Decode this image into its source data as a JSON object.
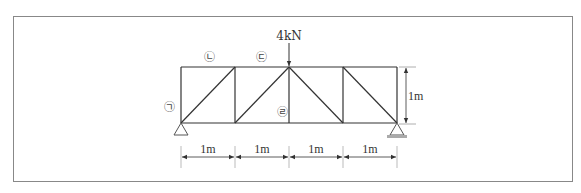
{
  "diagram": {
    "load": {
      "label": "4kN",
      "node_index": 2
    },
    "panels": 4,
    "panel_width_label": "1m",
    "height_label": "1m",
    "dimension_labels": [
      "1m",
      "1m",
      "1m",
      "1m"
    ],
    "member_labels": [
      {
        "id": "a",
        "text": "㉠",
        "member": "left-vertical"
      },
      {
        "id": "b",
        "text": "㉡",
        "member": "top-chord-panel-1"
      },
      {
        "id": "c",
        "text": "㉢",
        "member": "top-chord-panel-2"
      },
      {
        "id": "d",
        "text": "㉣",
        "member": "center-vertical"
      }
    ],
    "diagonals": [
      "up-right",
      "up-right",
      "down-right",
      "down-right"
    ],
    "supports": [
      {
        "type": "pin",
        "node_index": 0
      },
      {
        "type": "roller",
        "node_index": 4
      }
    ],
    "colors": {
      "line": "#333333",
      "frame": "#888888",
      "support_base": "#aaaaaa"
    }
  }
}
